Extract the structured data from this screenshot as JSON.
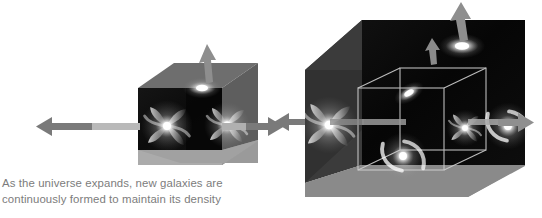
{
  "figure": {
    "title_visible": false,
    "background_color": "#ffffff",
    "caption": {
      "line1": "As the universe expands, new galaxies are",
      "line2": "continuously formed to maintain its density",
      "color": "#7c7c7c"
    },
    "palette": {
      "cube_top_face": "#6e6e6e",
      "cube_left_face": "#3a3a3a",
      "cube_bottom_face": "#9a9a9a",
      "cube_interior": "#0a0a0a",
      "arrow_gray": "#7a7a7a",
      "arrow_light": "#b4b4b4",
      "wireframe": "#cfcfcf",
      "galaxy_core": "#ffffff"
    },
    "cubes": [
      {
        "id": "small-cube",
        "label": "universe-at-earlier-time",
        "galaxies": 3,
        "arrows": [
          "left",
          "right",
          "up"
        ],
        "has_inner_wireframe": false
      },
      {
        "id": "large-cube",
        "label": "universe-after-expansion",
        "galaxies": 6,
        "arrows": [
          "left",
          "right",
          "up",
          "inner-up"
        ],
        "has_inner_wireframe": true,
        "wireframe_note": "original cube volume outlined inside expanded cube"
      }
    ],
    "connector_arrow": {
      "direction": "left",
      "meaning": "expansion-relation"
    }
  }
}
